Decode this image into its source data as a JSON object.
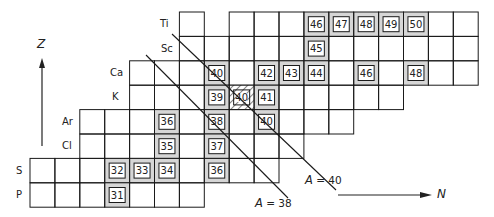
{
  "diagram": {
    "axes": {
      "z_label": "Z",
      "n_label": "N"
    },
    "grid": {
      "origin_x": 30,
      "col_width": 24.9,
      "row_top": 12,
      "row_height": 24.4
    },
    "rows": [
      {
        "element": "Ti",
        "label_x": 160,
        "segments": [
          [
            6,
            7
          ],
          [
            8,
            18
          ]
        ],
        "nuclides": [
          {
            "col": 11,
            "A": "46"
          },
          {
            "col": 12,
            "A": "47"
          },
          {
            "col": 13,
            "A": "48"
          },
          {
            "col": 14,
            "A": "49"
          },
          {
            "col": 15,
            "A": "50"
          }
        ]
      },
      {
        "element": "Sc",
        "label_x": 161,
        "segments": [
          [
            6,
            18
          ]
        ],
        "nuclides": [
          {
            "col": 11,
            "A": "45"
          }
        ]
      },
      {
        "element": "Ca",
        "label_x": 110,
        "segments": [
          [
            4,
            18
          ]
        ],
        "nuclides": [
          {
            "col": 7,
            "A": "40"
          },
          {
            "col": 9,
            "A": "42"
          },
          {
            "col": 10,
            "A": "43"
          },
          {
            "col": 11,
            "A": "44"
          },
          {
            "col": 13,
            "A": "46"
          },
          {
            "col": 15,
            "A": "48"
          }
        ]
      },
      {
        "element": "K",
        "label_x": 112,
        "segments": [
          [
            4,
            15
          ]
        ],
        "nuclides": [
          {
            "col": 7,
            "A": "39"
          },
          {
            "col": 8,
            "A": "40",
            "hatched": true
          },
          {
            "col": 9,
            "A": "41"
          }
        ]
      },
      {
        "element": "Ar",
        "label_x": 62,
        "segments": [
          [
            2,
            13
          ]
        ],
        "nuclides": [
          {
            "col": 5,
            "A": "36"
          },
          {
            "col": 7,
            "A": "38"
          },
          {
            "col": 9,
            "A": "40"
          }
        ]
      },
      {
        "element": "Cl",
        "label_x": 62,
        "segments": [
          [
            2,
            11
          ]
        ],
        "nuclides": [
          {
            "col": 5,
            "A": "35"
          },
          {
            "col": 7,
            "A": "37"
          }
        ]
      },
      {
        "element": "S",
        "label_x": 16,
        "segments": [
          [
            0,
            10
          ]
        ],
        "nuclides": [
          {
            "col": 3,
            "A": "32"
          },
          {
            "col": 4,
            "A": "33"
          },
          {
            "col": 5,
            "A": "34"
          },
          {
            "col": 7,
            "A": "36"
          }
        ]
      },
      {
        "element": "P",
        "label_x": 16,
        "segments": [
          [
            0,
            7
          ]
        ],
        "nuclides": [
          {
            "col": 3,
            "A": "31"
          }
        ]
      }
    ],
    "isobar_lines": [
      {
        "label_prefix": "A",
        "label_value": " = 40",
        "x1": 172,
        "y1": 34,
        "x2": 336,
        "y2": 190,
        "label_x": 305,
        "label_y": 174
      },
      {
        "label_prefix": "A",
        "label_value": " = 38",
        "x1": 146,
        "y1": 55,
        "x2": 288,
        "y2": 198,
        "label_x": 255,
        "label_y": 197
      }
    ],
    "colors": {
      "grid_line": "#1a1a1a",
      "stable_fill": "#d6d6d6",
      "box_fill": "#ffffff",
      "text": "#222222"
    }
  }
}
